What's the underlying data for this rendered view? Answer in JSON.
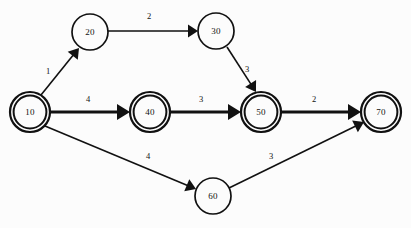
{
  "diagram": {
    "type": "directed-weighted-graph",
    "background_color": "#fcfcfc",
    "stroke_color": "#111111",
    "width": 411,
    "height": 228,
    "nodes": [
      {
        "id": "10",
        "label": "10",
        "cx": 30,
        "cy": 112,
        "r": 20,
        "double_circle": true,
        "name": "node-10"
      },
      {
        "id": "20",
        "label": "20",
        "cx": 90,
        "cy": 32,
        "r": 18,
        "double_circle": false,
        "name": "node-20"
      },
      {
        "id": "30",
        "label": "30",
        "cx": 216,
        "cy": 31,
        "r": 18,
        "double_circle": false,
        "name": "node-30"
      },
      {
        "id": "40",
        "label": "40",
        "cx": 150,
        "cy": 112,
        "r": 20,
        "double_circle": true,
        "name": "node-40"
      },
      {
        "id": "50",
        "label": "50",
        "cx": 261,
        "cy": 112,
        "r": 20,
        "double_circle": true,
        "name": "node-50"
      },
      {
        "id": "60",
        "label": "60",
        "cx": 213,
        "cy": 196,
        "r": 18,
        "double_circle": false,
        "name": "node-60"
      },
      {
        "id": "70",
        "label": "70",
        "cx": 381,
        "cy": 112,
        "r": 20,
        "double_circle": true,
        "name": "node-70"
      }
    ],
    "edges": [
      {
        "from": "10",
        "to": "20",
        "weight": "1",
        "x1": 41,
        "y1": 95,
        "x2": 79,
        "y2": 48,
        "lx": 48,
        "ly": 72,
        "thick": false,
        "name": "edge-10-20"
      },
      {
        "from": "20",
        "to": "30",
        "weight": "2",
        "x1": 108,
        "y1": 31,
        "x2": 198,
        "y2": 31,
        "lx": 149,
        "ly": 17,
        "thick": false,
        "name": "edge-20-30"
      },
      {
        "from": "30",
        "to": "50",
        "weight": "3",
        "x1": 227,
        "y1": 47,
        "x2": 256,
        "y2": 92,
        "lx": 247,
        "ly": 70,
        "thick": false,
        "name": "edge-30-50"
      },
      {
        "from": "10",
        "to": "40",
        "weight": "4",
        "x1": 50,
        "y1": 112,
        "x2": 130,
        "y2": 112,
        "lx": 88,
        "ly": 100,
        "thick": true,
        "name": "edge-10-40"
      },
      {
        "from": "40",
        "to": "50",
        "weight": "3",
        "x1": 170,
        "y1": 112,
        "x2": 241,
        "y2": 112,
        "lx": 201,
        "ly": 100,
        "thick": true,
        "name": "edge-40-50"
      },
      {
        "from": "50",
        "to": "70",
        "weight": "2",
        "x1": 281,
        "y1": 112,
        "x2": 361,
        "y2": 112,
        "lx": 314,
        "ly": 100,
        "thick": true,
        "name": "edge-50-70"
      },
      {
        "from": "10",
        "to": "60",
        "weight": "4",
        "x1": 45,
        "y1": 126,
        "x2": 196,
        "y2": 189,
        "lx": 148,
        "ly": 157,
        "thick": false,
        "name": "edge-10-60"
      },
      {
        "from": "60",
        "to": "70",
        "weight": "3",
        "x1": 229,
        "y1": 188,
        "x2": 364,
        "y2": 122,
        "lx": 271,
        "ly": 157,
        "thick": false,
        "name": "edge-60-70"
      }
    ]
  }
}
